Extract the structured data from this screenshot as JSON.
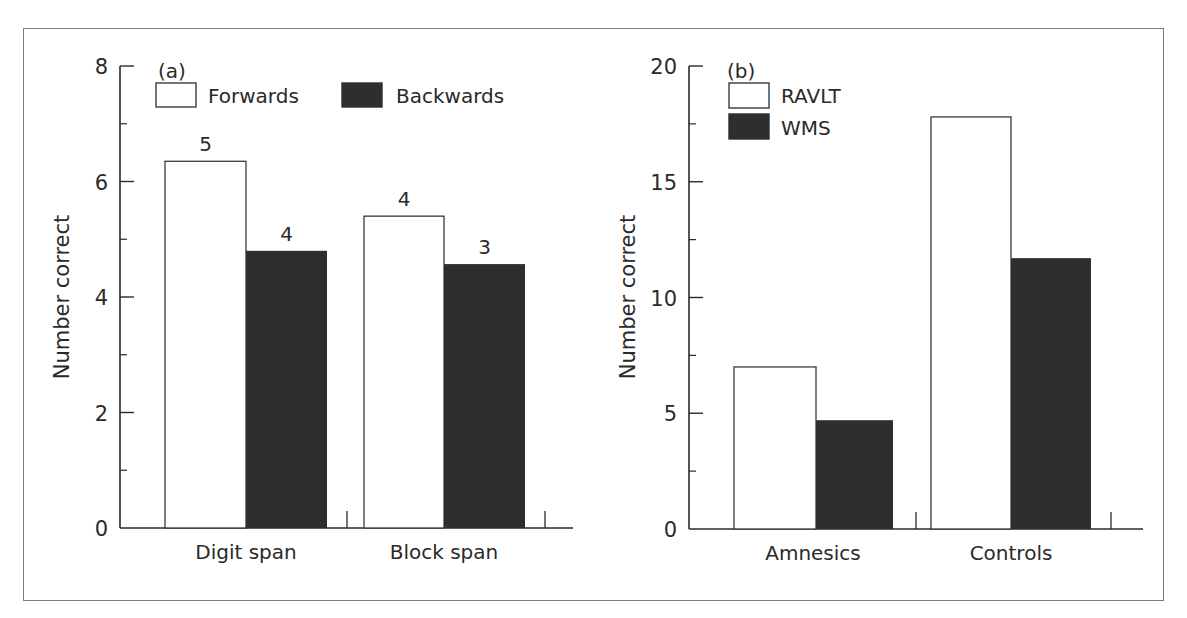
{
  "colors": {
    "axis": "#2a2a2a",
    "frame": "#7a7a7a",
    "series_light": "#ffffff",
    "series_dark": "#2e2e2e"
  },
  "chart_data": [
    {
      "type": "bar",
      "panel": "(a)",
      "title": "",
      "xlabel": "",
      "ylabel": "Number correct",
      "ylim": [
        0,
        8
      ],
      "yticks": [
        0,
        2,
        4,
        6,
        8
      ],
      "categories": [
        "Digit span",
        "Block span"
      ],
      "series": [
        {
          "name": "Forwards",
          "values": [
            6.35,
            5.4
          ],
          "bar_labels": [
            "5",
            "4"
          ],
          "fill": "#ffffff"
        },
        {
          "name": "Backwards",
          "values": [
            4.8,
            4.57
          ],
          "bar_labels": [
            "4",
            "3"
          ],
          "fill": "#2e2e2e"
        }
      ],
      "legend": {
        "position": "top-left",
        "orientation": "horizontal",
        "entries": [
          "Forwards",
          "Backwards"
        ]
      },
      "grid": false
    },
    {
      "type": "bar",
      "panel": "(b)",
      "title": "",
      "xlabel": "",
      "ylabel": "Number correct",
      "ylim": [
        0,
        20
      ],
      "yticks": [
        0,
        5,
        10,
        15,
        20
      ],
      "categories": [
        "Amnesics",
        "Controls"
      ],
      "series": [
        {
          "name": "RAVLT",
          "values": [
            7.0,
            17.8
          ],
          "fill": "#ffffff"
        },
        {
          "name": "WMS",
          "values": [
            4.7,
            11.7
          ],
          "fill": "#2e2e2e"
        }
      ],
      "legend": {
        "position": "top-left",
        "orientation": "vertical",
        "entries": [
          "RAVLT",
          "WMS"
        ]
      },
      "grid": false
    }
  ]
}
